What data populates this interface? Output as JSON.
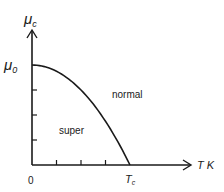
{
  "chart_data": {
    "type": "line",
    "xlabel": "T K",
    "ylabel": "μ_c",
    "y_intercept_label": "μ_0",
    "x_intercept_label": "T_c",
    "origin_label": "0",
    "regions": [
      "super",
      "normal"
    ],
    "curve": "parabolic: μ_c = μ_0 (1 - (T/T_c)^2)",
    "x_ticks_between_origin_and_Tc": 3,
    "y_ticks_between_origin_and_mu0": 3,
    "series": [
      {
        "name": "boundary",
        "x": [
          0,
          0.25,
          0.5,
          0.75,
          1.0
        ],
        "y": [
          1.0,
          0.9375,
          0.75,
          0.4375,
          0.0
        ]
      }
    ],
    "xlim": [
      0,
      1.6
    ],
    "ylim": [
      0,
      1.35
    ]
  },
  "labels": {
    "y_axis_main": "μ",
    "y_axis_sub": "c",
    "mu0_main": "μ",
    "mu0_sub": "0",
    "x_axis": "T K",
    "tc_main": "T",
    "tc_sub": "c",
    "origin": "0",
    "region_super": "super",
    "region_normal": "normal"
  }
}
